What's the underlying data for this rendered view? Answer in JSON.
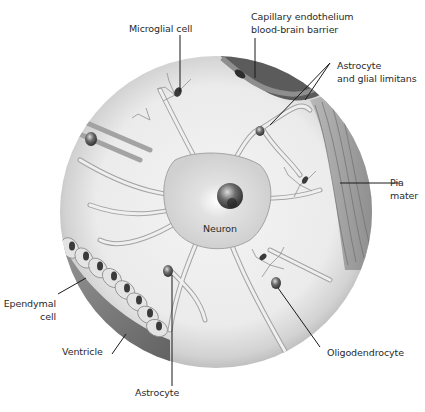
{
  "figure": {
    "center": "Neuron",
    "labels": {
      "microglial": "Microglial cell",
      "capillary_line1": "Capillary endothelium",
      "capillary_line2": "blood-brain barrier",
      "astro_glial_line1": "Astrocyte",
      "astro_glial_line2": "and glial limitans",
      "pia_line1": "Pia",
      "pia_line2": "mater",
      "neuron": "Neuron",
      "ependymal_line1": "Ependymal",
      "ependymal_line2": "cell",
      "ventricle": "Ventricle",
      "astrocyte": "Astrocyte",
      "oligodendrocyte": "Oligodendrocyte"
    },
    "colors": {
      "background": "#ffffff",
      "tissue": "#ececec",
      "cell_fill": "#d9d9d9",
      "cell_stroke": "#9a9a9a",
      "nucleus": "#444444",
      "leader_line": "#1a1a1a",
      "vessel": "#5a5a5a",
      "pia": "#9c9c9c",
      "ventricle_shadow": "#7a7a7a"
    }
  }
}
